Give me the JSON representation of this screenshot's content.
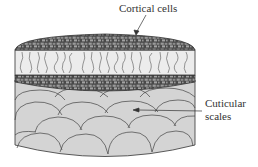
{
  "diagram": {
    "labels": {
      "cortical": "Cortical cells",
      "cuticular_line1": "Cuticular",
      "cuticular_line2": "scales"
    },
    "colors": {
      "cortex": "#6f6f6f",
      "band": "#ececec",
      "scales": "#d4d4d4",
      "stroke": "#333333"
    }
  }
}
